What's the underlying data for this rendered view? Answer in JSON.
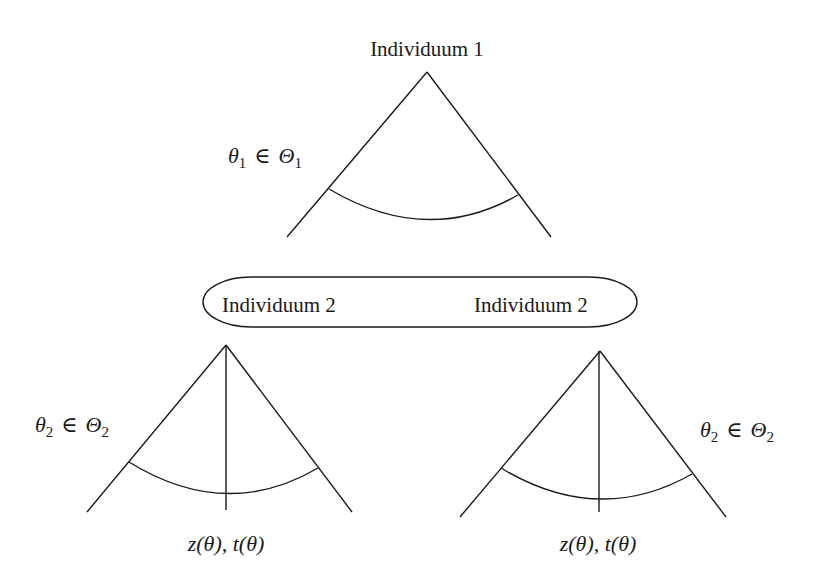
{
  "diagram": {
    "type": "game-tree",
    "nodes": {
      "player1": {
        "label": "Individuum 1",
        "type_label": {
          "var": "θ",
          "sub": "1",
          "rel": "∈",
          "set": "Θ",
          "set_sub": "1"
        }
      },
      "player2_info_set": {
        "labels": [
          "Individuum 2",
          "Individuum 2"
        ]
      },
      "player2_left": {
        "type_label": {
          "var": "θ",
          "sub": "2",
          "rel": "∈",
          "set": "Θ",
          "set_sub": "2"
        },
        "outcome_label": "z(θ), t(θ)"
      },
      "player2_right": {
        "type_label": {
          "var": "θ",
          "sub": "2",
          "rel": "∈",
          "set": "Θ",
          "set_sub": "2"
        },
        "outcome_label": "z(θ), t(θ)"
      }
    },
    "colors": {
      "ink": "#1a1a1a",
      "background": "#ffffff"
    }
  }
}
